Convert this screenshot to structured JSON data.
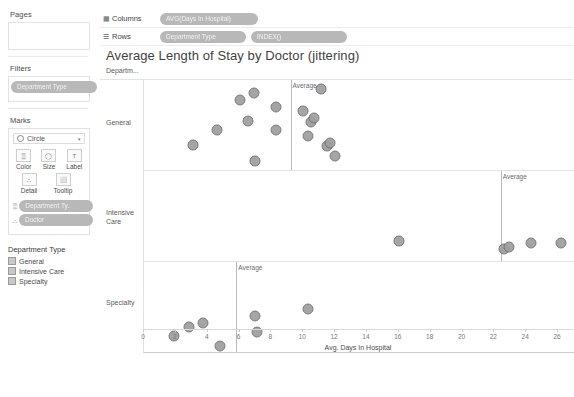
{
  "shelves": {
    "pages_label": "Pages",
    "filters_label": "Filters",
    "filters_pill": "Department Type",
    "columns_label": "Columns",
    "columns_icon": "columns-icon",
    "columns_pill": "AVG(Days In Hospital)",
    "rows_label": "Rows",
    "rows_icon": "rows-icon",
    "rows_pills": [
      "Department Type",
      "INDEX()"
    ]
  },
  "marks": {
    "title": "Marks",
    "mark_type": "Circle",
    "caret": "▾",
    "buttons_row1": [
      {
        "label": "Color",
        "icon": "color-icon",
        "glyph": "▒"
      },
      {
        "label": "Size",
        "icon": "size-icon",
        "glyph": "◯"
      },
      {
        "label": "Label",
        "icon": "label-icon",
        "glyph": "T"
      }
    ],
    "buttons_row2": [
      {
        "label": "Detail",
        "icon": "detail-icon",
        "glyph": "∴"
      },
      {
        "label": "Tooltip",
        "icon": "tooltip-icon",
        "glyph": "⬜"
      }
    ],
    "pills": [
      {
        "label": "Department Ty..",
        "icon": "color-pill-icon",
        "glyph": "▒"
      },
      {
        "label": "Doctor",
        "icon": "detail-pill-icon",
        "glyph": "∴"
      }
    ]
  },
  "legend": {
    "title": "Department Type",
    "items": [
      "General",
      "Intensive Care",
      "Specialty"
    ]
  },
  "viz": {
    "title": "Average Length of Stay by Doctor (jittering)",
    "row_header_title": "Departm...",
    "reference_label": "Average",
    "mark_color": "#9e9e9e",
    "mark_border": "#6f6f6f"
  },
  "chart_data": {
    "type": "scatter",
    "title": "Average Length of Stay by Doctor (jittering)",
    "xlabel": "Avg. Days In Hospital",
    "ylabel": "",
    "xlim": [
      0,
      27
    ],
    "xticks": [
      0,
      2,
      4,
      6,
      8,
      10,
      12,
      14,
      16,
      18,
      20,
      22,
      24,
      26
    ],
    "grid": false,
    "legend_position": "left-sidebar",
    "jitter_axis": "y (INDEX)",
    "panels": [
      {
        "name": "General",
        "average": 9.2,
        "points": [
          {
            "x": 3.1,
            "y": 0.72
          },
          {
            "x": 4.6,
            "y": 0.56
          },
          {
            "x": 6.0,
            "y": 0.22
          },
          {
            "x": 6.9,
            "y": 0.14
          },
          {
            "x": 6.5,
            "y": 0.45
          },
          {
            "x": 7.0,
            "y": 0.9
          },
          {
            "x": 8.3,
            "y": 0.3
          },
          {
            "x": 8.3,
            "y": 0.55
          },
          {
            "x": 10.0,
            "y": 0.34
          },
          {
            "x": 10.5,
            "y": 0.47
          },
          {
            "x": 10.7,
            "y": 0.42
          },
          {
            "x": 10.3,
            "y": 0.62
          },
          {
            "x": 11.1,
            "y": 0.1
          },
          {
            "x": 11.5,
            "y": 0.73
          },
          {
            "x": 11.7,
            "y": 0.7
          },
          {
            "x": 12.0,
            "y": 0.84
          }
        ]
      },
      {
        "name": "Intensive Care",
        "average": 22.4,
        "points": [
          {
            "x": 16.0,
            "y": 0.78
          },
          {
            "x": 22.6,
            "y": 0.87
          },
          {
            "x": 22.9,
            "y": 0.84
          },
          {
            "x": 24.3,
            "y": 0.8
          },
          {
            "x": 26.2,
            "y": 0.8
          }
        ]
      },
      {
        "name": "Specialty",
        "average": 5.8,
        "points": [
          {
            "x": 1.9,
            "y": 0.82
          },
          {
            "x": 2.8,
            "y": 0.72
          },
          {
            "x": 3.7,
            "y": 0.68
          },
          {
            "x": 4.8,
            "y": 0.93
          },
          {
            "x": 7.0,
            "y": 0.6
          },
          {
            "x": 7.1,
            "y": 0.78
          },
          {
            "x": 10.3,
            "y": 0.52
          }
        ]
      }
    ]
  }
}
